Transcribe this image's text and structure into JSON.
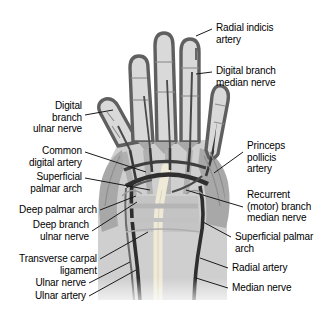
{
  "figure": {
    "background_color": "#ffffff",
    "text_color": "#000000",
    "leader_line_color": "#1a1a1a",
    "palette": {
      "skin_light": "#d9d9d9",
      "skin_mid": "#bcbcbc",
      "skin_shadow": "#9a9a9a",
      "outline_dark": "#5f5f5f",
      "vessel_dark": "#3a3a3a",
      "nerve_cream": "#efead8",
      "muscle_gray": "#8f8f8f"
    }
  },
  "labels": {
    "radial_indicis_artery": "Radial indicis\nartery",
    "digital_branch_median_nerve": "Digital branch\nmedian nerve",
    "digital_branch_ulnar_nerve": "Digital\nbranch\nulnar nerve",
    "common_digital_artery": "Common\ndigital artery",
    "superficial_palmar_arch_left": "Superficial\npalmar arch",
    "deep_palmar_arch": "Deep palmar arch",
    "deep_branch_ulnar_nerve": "Deep branch\nulnar nerve",
    "transverse_carpal_ligament": "Transverse carpal\nligament",
    "ulnar_nerve": "Ulnar nerve",
    "ulnar_artery": "Ulnar artery",
    "princeps_pollicis_artery": "Princeps\npollicis\nartery",
    "recurrent_motor_branch_median_nerve": "Recurrent\n(motor) branch\nmedian nerve",
    "superficial_palmar_arch_right": "Superficial palmar\narch",
    "radial_artery": "Radial artery",
    "median_nerve": "Median nerve"
  }
}
